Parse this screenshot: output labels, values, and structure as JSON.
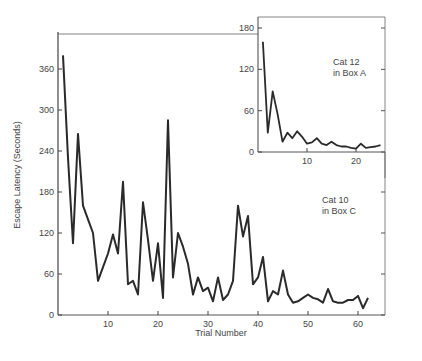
{
  "chart_data": [
    {
      "type": "line",
      "name": "main",
      "title": "",
      "xlabel": "Trial Number",
      "ylabel": "Escape Latency (Seconds)",
      "annotation": [
        "Cat 10",
        "in Box C"
      ],
      "xlim": [
        0,
        66
      ],
      "ylim": [
        0,
        400
      ],
      "xticks": [
        10,
        20,
        30,
        40,
        50,
        60
      ],
      "yticks": [
        0,
        60,
        120,
        180,
        240,
        300,
        360
      ],
      "grid": false,
      "series": [
        {
          "name": "Cat 10 in Box C",
          "x": [
            1,
            2,
            3,
            4,
            5,
            6,
            7,
            8,
            9,
            10,
            11,
            12,
            13,
            14,
            15,
            16,
            17,
            18,
            19,
            20,
            21,
            22,
            23,
            24,
            25,
            26,
            27,
            28,
            29,
            30,
            31,
            32,
            33,
            34,
            35,
            36,
            37,
            38,
            39,
            40,
            41,
            42,
            43,
            44,
            45,
            46,
            47,
            48,
            49,
            50,
            51,
            52,
            53,
            54,
            55,
            56,
            57,
            58,
            59,
            60,
            61,
            62
          ],
          "values": [
            380,
            230,
            105,
            265,
            160,
            140,
            120,
            50,
            70,
            90,
            118,
            90,
            195,
            45,
            50,
            30,
            165,
            110,
            50,
            105,
            25,
            285,
            55,
            120,
            100,
            75,
            30,
            55,
            35,
            40,
            20,
            55,
            22,
            30,
            50,
            160,
            115,
            145,
            45,
            55,
            85,
            20,
            35,
            30,
            65,
            30,
            18,
            20,
            25,
            30,
            25,
            23,
            18,
            38,
            20,
            18,
            18,
            22,
            22,
            28,
            10,
            25
          ]
        }
      ]
    },
    {
      "type": "line",
      "name": "inset",
      "title": "",
      "xlabel": "",
      "ylabel": "",
      "annotation": [
        "Cat 12",
        "in Box A"
      ],
      "xlim": [
        0,
        26
      ],
      "ylim": [
        0,
        195
      ],
      "xticks": [
        10,
        20
      ],
      "yticks": [
        0,
        60,
        120,
        180
      ],
      "grid": false,
      "series": [
        {
          "name": "Cat 12 in Box A",
          "x": [
            1,
            2,
            3,
            4,
            5,
            6,
            7,
            8,
            9,
            10,
            11,
            12,
            13,
            14,
            15,
            16,
            17,
            18,
            19,
            20,
            21,
            22,
            23,
            24,
            25
          ],
          "values": [
            160,
            28,
            88,
            55,
            15,
            28,
            20,
            30,
            22,
            12,
            14,
            20,
            12,
            10,
            15,
            10,
            8,
            8,
            6,
            5,
            12,
            6,
            7,
            8,
            10
          ]
        }
      ]
    }
  ]
}
